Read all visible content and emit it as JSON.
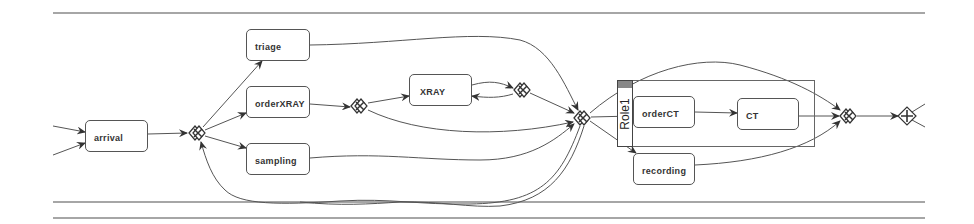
{
  "diagram": {
    "type": "process-model",
    "swimlane_lines_y": [
      13,
      202,
      218
    ],
    "colors": {
      "stroke": "#555555",
      "role_header_fill": "#888888",
      "background": "#ffffff"
    },
    "activities": [
      {
        "id": "arrival",
        "label": "arrival"
      },
      {
        "id": "triage",
        "label": "triage"
      },
      {
        "id": "orderXRAY",
        "label": "orderXRAY"
      },
      {
        "id": "sampling",
        "label": "sampling"
      },
      {
        "id": "XRAY",
        "label": "XRAY"
      },
      {
        "id": "orderCT",
        "label": "orderCT"
      },
      {
        "id": "CT",
        "label": "CT"
      },
      {
        "id": "recording",
        "label": "recording"
      }
    ],
    "gateways": [
      {
        "id": "g1",
        "type": "xor"
      },
      {
        "id": "g2",
        "type": "xor"
      },
      {
        "id": "g3",
        "type": "xor"
      },
      {
        "id": "g4",
        "type": "xor"
      },
      {
        "id": "g5",
        "type": "xor"
      },
      {
        "id": "g6",
        "type": "and"
      }
    ],
    "role": {
      "label": "Role1"
    }
  }
}
